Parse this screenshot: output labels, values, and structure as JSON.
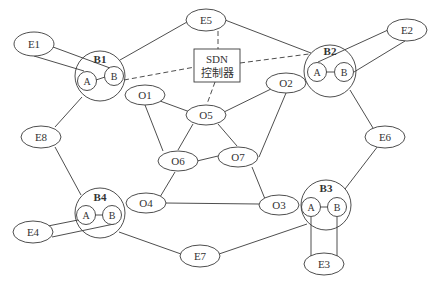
{
  "diagram": {
    "type": "network-topology",
    "controller": {
      "line1": "SDN",
      "line2": "控制器"
    },
    "border_nodes": [
      {
        "id": "B1",
        "label": "B1",
        "a": "A",
        "b": "B"
      },
      {
        "id": "B2",
        "label": "B2",
        "a": "A",
        "b": "B"
      },
      {
        "id": "B3",
        "label": "B3",
        "a": "A",
        "b": "B"
      },
      {
        "id": "B4",
        "label": "B4",
        "a": "A",
        "b": "B"
      }
    ],
    "external_nodes": [
      "E1",
      "E2",
      "E3",
      "E4",
      "E5",
      "E6",
      "E7",
      "E8"
    ],
    "internal_nodes": [
      "O1",
      "O2",
      "O3",
      "O4",
      "O5",
      "O6",
      "O7"
    ],
    "edges": [
      [
        "E1",
        "B1.A"
      ],
      [
        "E1",
        "B1.B"
      ],
      [
        "B1.A",
        "B1.B"
      ],
      [
        "B1",
        "E5"
      ],
      [
        "B1",
        "E8"
      ],
      [
        "E5",
        "B2"
      ],
      [
        "E2",
        "B2.A"
      ],
      [
        "E2",
        "B2.B"
      ],
      [
        "B2.A",
        "B2.B"
      ],
      [
        "B2",
        "E6"
      ],
      [
        "E8",
        "B4"
      ],
      [
        "E4",
        "B4.A"
      ],
      [
        "E4",
        "B4.B"
      ],
      [
        "B4.A",
        "B4.B"
      ],
      [
        "B4",
        "E7"
      ],
      [
        "E7",
        "B3"
      ],
      [
        "E6",
        "B3"
      ],
      [
        "E3",
        "B3.A"
      ],
      [
        "E3",
        "B3.B"
      ],
      [
        "B3.A",
        "B3.B"
      ],
      [
        "O1",
        "O5"
      ],
      [
        "O1",
        "O6"
      ],
      [
        "O5",
        "O2"
      ],
      [
        "O5",
        "O6"
      ],
      [
        "O5",
        "O7"
      ],
      [
        "O2",
        "O7"
      ],
      [
        "O6",
        "O7"
      ],
      [
        "O6",
        "O4"
      ],
      [
        "O7",
        "O3"
      ],
      [
        "O4",
        "O3"
      ]
    ],
    "control_links_dashed": [
      [
        "SDN",
        "E5"
      ],
      [
        "SDN",
        "B1.B"
      ],
      [
        "SDN",
        "B2"
      ],
      [
        "SDN",
        "O5"
      ]
    ]
  },
  "labels": {
    "E1": "E1",
    "E2": "E2",
    "E3": "E3",
    "E4": "E4",
    "E5": "E5",
    "E6": "E6",
    "E7": "E7",
    "E8": "E8",
    "O1": "O1",
    "O2": "O2",
    "O3": "O3",
    "O4": "O4",
    "O5": "O5",
    "O6": "O6",
    "O7": "O7",
    "B1": "B1",
    "B2": "B2",
    "B3": "B3",
    "B4": "B4",
    "A": "A",
    "B": "B",
    "sdn1": "SDN",
    "sdn2": "控制器"
  }
}
